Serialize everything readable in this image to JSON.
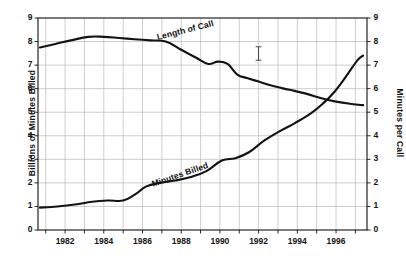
{
  "chart_data": {
    "type": "line",
    "title": "",
    "subtitle": "",
    "xlabel": "",
    "ylabel": "Billions of Minutes Billed",
    "y2label": "Minutes per Call",
    "xlim": [
      1980.6,
      1997.6
    ],
    "ylim": [
      0,
      9
    ],
    "y2lim": [
      0,
      9
    ],
    "grid": true,
    "legend_position": "inline-annotations",
    "x_tick_labels": [
      "1982",
      "1984",
      "1986",
      "1988",
      "1990",
      "1992",
      "1994",
      "1996"
    ],
    "x_tick_values": [
      1982,
      1984,
      1986,
      1988,
      1990,
      1992,
      1994,
      1996
    ],
    "x_minor_tick_values": [
      1981,
      1983,
      1985,
      1987,
      1989,
      1991,
      1993,
      1995,
      1997
    ],
    "y_tick_labels": [
      "0",
      "1",
      "2",
      "3",
      "4",
      "5",
      "6",
      "7",
      "8",
      "9"
    ],
    "y_tick_values": [
      0,
      1,
      2,
      3,
      4,
      5,
      6,
      7,
      8,
      9
    ],
    "y2_tick_labels": [
      "0",
      "1",
      "2",
      "3",
      "4",
      "5",
      "6",
      "7",
      "8",
      "9"
    ],
    "y2_tick_values": [
      0,
      1,
      2,
      3,
      4,
      5,
      6,
      7,
      8,
      9
    ],
    "series": [
      {
        "name": "Length of Call",
        "axis": "right",
        "units": "Minutes per Call",
        "x": [
          1980.7,
          1981.5,
          1982.3,
          1983.2,
          1984.0,
          1984.8,
          1985.6,
          1986.4,
          1987.2,
          1988.0,
          1988.8,
          1989.4,
          1989.9,
          1990.4,
          1990.9,
          1991.4,
          1992.0,
          1992.8,
          1993.6,
          1994.4,
          1995.2,
          1996.0,
          1996.8,
          1997.4
        ],
        "values": [
          7.75,
          7.9,
          8.05,
          8.2,
          8.2,
          8.15,
          8.1,
          8.05,
          8.0,
          7.65,
          7.3,
          7.05,
          7.15,
          7.05,
          6.6,
          6.45,
          6.3,
          6.1,
          5.95,
          5.8,
          5.6,
          5.45,
          5.35,
          5.3
        ]
      },
      {
        "name": "Minutes Billed",
        "axis": "left",
        "units": "Billions of Minutes Billed",
        "x": [
          1980.7,
          1981.6,
          1982.5,
          1983.4,
          1984.2,
          1985.0,
          1985.6,
          1986.2,
          1986.9,
          1987.7,
          1988.5,
          1989.3,
          1990.1,
          1990.8,
          1991.5,
          1992.3,
          1993.1,
          1993.9,
          1994.7,
          1995.3,
          1995.9,
          1996.5,
          1997.1,
          1997.4
        ],
        "values": [
          0.95,
          1.0,
          1.08,
          1.2,
          1.25,
          1.25,
          1.5,
          1.85,
          2.0,
          2.1,
          2.25,
          2.5,
          2.95,
          3.05,
          3.3,
          3.8,
          4.2,
          4.55,
          4.95,
          5.35,
          5.85,
          6.5,
          7.2,
          7.4
        ]
      }
    ],
    "annotations": [
      {
        "text": "Length of Call",
        "series": "Length of Call",
        "rotation_deg": -14
      },
      {
        "text": "Minutes Billed",
        "series": "Minutes Billed",
        "rotation_deg": -19
      }
    ],
    "colors": {
      "line": "#131313",
      "grid": "#b9b9b9",
      "frame": "#111111",
      "background": "#ffffff",
      "text": "#141414"
    }
  },
  "cursor": {
    "icon": "text-cursor-ibeam",
    "x": 258,
    "y": 53
  }
}
